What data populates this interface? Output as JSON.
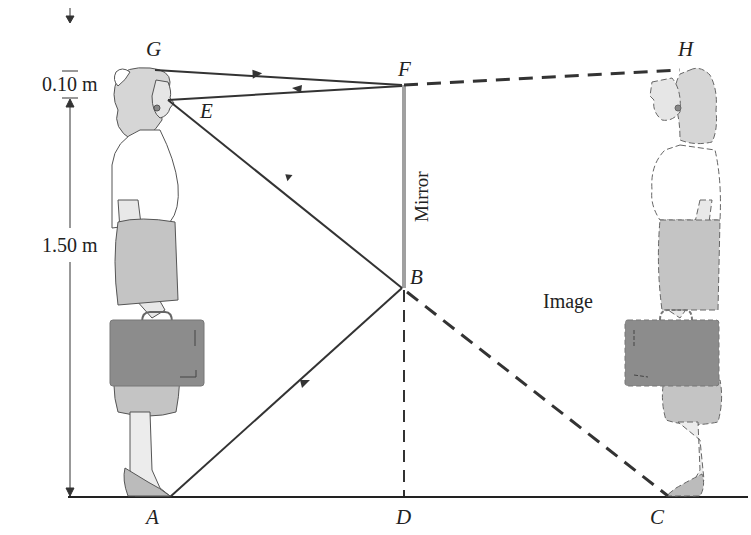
{
  "diagram": {
    "points": {
      "G": "G",
      "H": "H",
      "F": "F",
      "E": "E",
      "B": "B",
      "A": "A",
      "D": "D",
      "C": "C"
    },
    "dimensions": {
      "top": "0.10 m",
      "bottom": "1.50 m"
    },
    "labels": {
      "mirror": "Mirror",
      "image": "Image"
    },
    "colors": {
      "ray": "#333333",
      "mirror": "#a0a0a0",
      "figure_fill": "#d9d9d9",
      "skirt_fill": "#c4c4c4",
      "briefcase_fill": "#8c8c8c",
      "outline": "#555555",
      "ground": "#222222"
    },
    "rays": [
      {
        "from": "G",
        "to": "F",
        "style": "solid",
        "arrow": "toward F"
      },
      {
        "from": "F",
        "to": "E",
        "style": "solid",
        "arrow": "toward E"
      },
      {
        "from": "A",
        "to": "B",
        "style": "solid",
        "arrow": "toward B"
      },
      {
        "from": "B",
        "to": "E",
        "style": "solid",
        "arrow": "toward E"
      },
      {
        "from": "F",
        "to": "H",
        "style": "dashed"
      },
      {
        "from": "B",
        "to": "C",
        "style": "dashed"
      },
      {
        "from": "B",
        "to": "D",
        "style": "dashed"
      }
    ]
  }
}
